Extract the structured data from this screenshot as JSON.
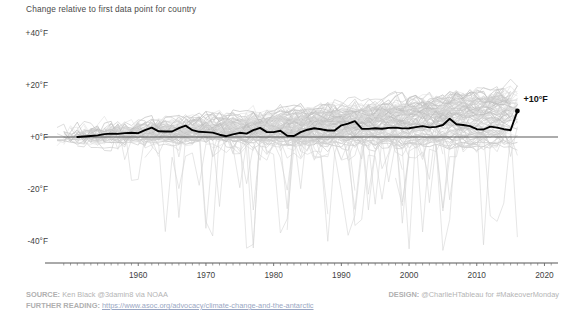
{
  "chart_data": {
    "type": "line",
    "title": "",
    "subtitle": "Change relative to first data point for country",
    "xlabel": "",
    "ylabel": "",
    "xlim": [
      1948,
      2022
    ],
    "ylim": [
      -48,
      44
    ],
    "grid": false,
    "legend_position": "none",
    "yticks": [
      {
        "value": 40,
        "label": "+40°F"
      },
      {
        "value": 20,
        "label": "+20°F"
      },
      {
        "value": 0,
        "label": "+0°F"
      },
      {
        "value": -20,
        "label": "-20°F"
      },
      {
        "value": -40,
        "label": "-40°F"
      }
    ],
    "xticks": [
      {
        "value": 1960,
        "label": "1960"
      },
      {
        "value": 1970,
        "label": "1970"
      },
      {
        "value": 1980,
        "label": "1980"
      },
      {
        "value": 1990,
        "label": "1990"
      },
      {
        "value": 2000,
        "label": "2000"
      },
      {
        "value": 2010,
        "label": "2010"
      },
      {
        "value": 2020,
        "label": "2020"
      }
    ],
    "minor_tick_step": 1,
    "zero_line": 0,
    "annotations": [
      {
        "text": "+10°F",
        "x": 2016,
        "y": 10,
        "dx": 6,
        "dy": -10
      }
    ],
    "colors": {
      "background_series": "#cfcfcf",
      "highlight_series": "#000000",
      "zero_line": "#5a5a5a",
      "axis_text": "#3f3f3f",
      "footer_text": "#b4b4b4",
      "link": "#8e9ec4"
    },
    "series": [
      {
        "name": "Highlighted country",
        "highlight": true,
        "x": [
          1951,
          1952,
          1953,
          1954,
          1955,
          1956,
          1957,
          1958,
          1959,
          1960,
          1961,
          1962,
          1963,
          1964,
          1965,
          1966,
          1967,
          1968,
          1969,
          1970,
          1971,
          1972,
          1973,
          1974,
          1975,
          1976,
          1977,
          1978,
          1979,
          1980,
          1981,
          1982,
          1983,
          1984,
          1985,
          1986,
          1987,
          1988,
          1989,
          1990,
          1991,
          1992,
          1993,
          1994,
          1995,
          1996,
          1997,
          1998,
          1999,
          2000,
          2001,
          2002,
          2003,
          2004,
          2005,
          2006,
          2007,
          2008,
          2009,
          2010,
          2011,
          2012,
          2013,
          2014,
          2015,
          2016
        ],
        "values": [
          0.0,
          0.2,
          0.4,
          0.6,
          1.1,
          1.3,
          1.2,
          1.5,
          1.6,
          1.5,
          2.6,
          3.6,
          2.2,
          2.1,
          2.1,
          3.4,
          4.4,
          2.6,
          2.0,
          1.9,
          1.7,
          0.9,
          0.3,
          1.0,
          1.6,
          1.3,
          2.6,
          3.5,
          1.9,
          1.9,
          2.4,
          0.5,
          0.4,
          1.9,
          2.8,
          3.4,
          3.0,
          2.5,
          2.5,
          4.5,
          5.1,
          6.1,
          3.2,
          3.1,
          3.4,
          3.2,
          3.5,
          3.6,
          3.3,
          3.4,
          3.8,
          4.2,
          3.7,
          3.9,
          4.6,
          7.0,
          4.9,
          4.6,
          4.2,
          3.0,
          2.9,
          4.0,
          3.6,
          3.0,
          2.6,
          10.0
        ]
      },
      {
        "name": "country-band",
        "highlight": false,
        "count": 96,
        "spread_low": -14,
        "spread_high": 26,
        "outlier_count": 14,
        "outlier_min": -46
      }
    ]
  },
  "footer": {
    "source_label": "SOURCE:",
    "source_text": "Ken Black @3damin8 via NOAA",
    "design_label": "DESIGN:",
    "design_text": "@CharlieHTableau for #MakeoverMonday",
    "further_label": "FURTHER READING:",
    "further_url": "https://www.asoc.org/advocacy/climate-change-and-the-antarctic"
  }
}
